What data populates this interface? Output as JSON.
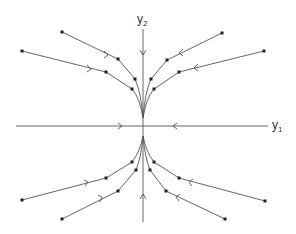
{
  "diagram": {
    "type": "phase-portrait",
    "colors": {
      "line": "#555555",
      "point": "#222222",
      "background": "#ffffff"
    },
    "axes": {
      "horizontal": {
        "label": "y",
        "subscript": "1"
      },
      "vertical": {
        "label": "y",
        "subscript": "2"
      }
    },
    "trajectories": [
      {
        "id": "upper-left-outer",
        "points": [
          [
            22,
            51
          ],
          [
            106,
            72
          ],
          [
            132,
            89
          ]
        ],
        "arrow_at": [
          89,
          68
        ],
        "direction": "toward-origin"
      },
      {
        "id": "upper-left-inner",
        "points": [
          [
            62,
            32
          ],
          [
            118,
            59
          ],
          [
            135,
            79
          ]
        ],
        "arrow_at": [
          106,
          54
        ],
        "direction": "toward-origin"
      },
      {
        "id": "upper-right-inner",
        "points": [
          [
            222,
            33
          ],
          [
            167,
            60
          ],
          [
            151,
            79
          ]
        ],
        "arrow_at": [
          181,
          52
        ],
        "direction": "toward-origin"
      },
      {
        "id": "upper-right-outer",
        "points": [
          [
            264,
            51
          ],
          [
            179,
            72
          ],
          [
            154,
            89
          ]
        ],
        "arrow_at": [
          196,
          67
        ],
        "direction": "toward-origin"
      },
      {
        "id": "lower-left-outer",
        "points": [
          [
            22,
            200
          ],
          [
            106,
            178
          ],
          [
            132,
            162
          ]
        ],
        "arrow_at": [
          86,
          183
        ],
        "direction": "toward-origin"
      },
      {
        "id": "lower-left-inner",
        "points": [
          [
            62,
            219
          ],
          [
            118,
            191
          ],
          [
            136,
            170
          ]
        ],
        "arrow_at": [
          100,
          199
        ],
        "direction": "toward-origin"
      },
      {
        "id": "lower-right-inner",
        "points": [
          [
            225,
            219
          ],
          [
            166,
            191
          ],
          [
            150,
            170
          ]
        ],
        "arrow_at": [
          178,
          197
        ],
        "direction": "toward-origin"
      },
      {
        "id": "lower-right-outer",
        "points": [
          [
            265,
            201
          ],
          [
            179,
            178
          ],
          [
            154,
            162
          ]
        ],
        "arrow_at": [
          191,
          182
        ],
        "direction": "toward-origin"
      }
    ],
    "axis_arrows": [
      {
        "on": "vertical-upper",
        "at": [
          143,
          53
        ],
        "direction": "down"
      },
      {
        "on": "vertical-lower",
        "at": [
          143,
          196
        ],
        "direction": "up"
      },
      {
        "on": "horizontal-left",
        "at": [
          120,
          126
        ],
        "direction": "right"
      },
      {
        "on": "horizontal-right",
        "at": [
          175,
          126
        ],
        "direction": "left"
      }
    ]
  }
}
